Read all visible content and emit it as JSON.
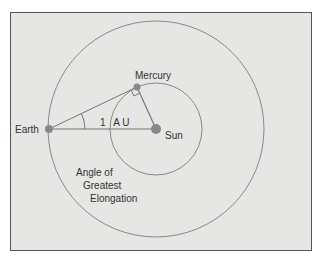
{
  "diagram": {
    "labels": {
      "earth": "Earth",
      "sun": "Sun",
      "mercury": "Mercury",
      "distance": "1   A U",
      "angle_line1": "Angle of",
      "angle_line2": "Greatest",
      "angle_line3": "Elongation"
    },
    "colors": {
      "background": "#e6e6e4",
      "line": "#777777",
      "body": "#888888",
      "text": "#333333"
    }
  }
}
